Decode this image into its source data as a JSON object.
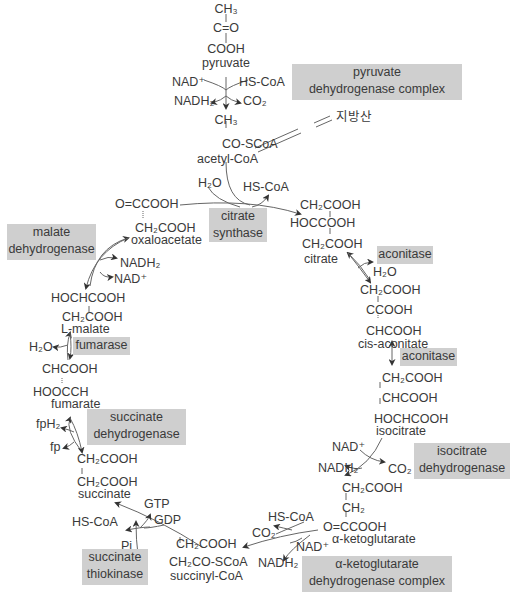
{
  "colors": {
    "enzyme_box": "#cfcfcf",
    "text": "#3a3a3a",
    "line": "#555555"
  },
  "pyruvate": {
    "ch3": "CH₃",
    "co": "C=O",
    "cooh": "COOH",
    "name": "pyruvate"
  },
  "pdh_step": {
    "nad": "NAD⁺",
    "hscoa": "HS-CoA",
    "nadh2": "NADH₂",
    "co2": "CO₂"
  },
  "acetyl_coa": {
    "ch3": "CH₃",
    "coscoa": "CO-SCoA",
    "name": "acetyl-CoA"
  },
  "fatty_acid": "지방산",
  "citrate_synthase_step": {
    "h2o": "H₂O",
    "hscoa": "HS-CoA"
  },
  "oxaloacetate": {
    "line1": "O=CCOOH",
    "line2": "CH₂COOH",
    "name": "oxaloacetate"
  },
  "citrate": {
    "line1": "CH₂COOH",
    "line2": "HOCCOOH",
    "line3": "CH₂COOH",
    "name": "citrate"
  },
  "aconitase1_step": {
    "h2o": "H₂O"
  },
  "cis_aconitate": {
    "line1": "CH₂COOH",
    "line2": "CCOOH",
    "line3": "CHCOOH",
    "name": "cis-aconitate"
  },
  "isocitrate": {
    "line1": "CH₂COOH",
    "line2": "CHCOOH",
    "line3": "HOCHCOOH",
    "name": "isocitrate"
  },
  "icdh_step": {
    "nad": "NAD⁺",
    "nadh2": "NADH₂",
    "co2": "CO₂"
  },
  "alpha_kg": {
    "line1": "CH₂COOH",
    "line2": "CH₂",
    "line3": "O=CCOOH",
    "name": "α-ketoglutarate"
  },
  "akgdh_step": {
    "hscoa": "HS-CoA",
    "co2": "CO₂",
    "nad": "NAD⁺",
    "nadh2": "NADH₂"
  },
  "succinyl_coa": {
    "line1": "CH₂COOH",
    "line2": "CH₂CO-SCoA",
    "name": "succinyl-CoA"
  },
  "st_step": {
    "gtp": "GTP",
    "gdp": "GDP",
    "hscoa": "HS-CoA",
    "pi": "Pi"
  },
  "succinate": {
    "line1": "CH₂COOH",
    "line2": "CH₂COOH",
    "name": "succinate"
  },
  "sdh_step": {
    "fph2": "fpH₂",
    "fp": "fp"
  },
  "fumarate": {
    "line1": "CHCOOH",
    "line2": "HOOCCH",
    "name": "fumarate"
  },
  "fumarase_step": {
    "h2o": "H₂O"
  },
  "malate": {
    "line1": "HOCHCOOH",
    "line2": "CH₂COOH",
    "name": "L-malate"
  },
  "mdh_step": {
    "nadh2": "NADH₂",
    "nad": "NAD⁺"
  },
  "enzymes": {
    "pdh": {
      "line1": "pyruvate",
      "line2": "dehydrogenase complex"
    },
    "citrate_synthase": {
      "line1": "citrate",
      "line2": "synthase"
    },
    "aconitase1": "aconitase",
    "aconitase2": "aconitase",
    "icdh": {
      "line1": "isocitrate",
      "line2": "dehydrogenase"
    },
    "akgdh": {
      "line1": "α-ketoglutarate",
      "line2": "dehydrogenase complex"
    },
    "succinate_thiokinase": {
      "line1": "succinate",
      "line2": "thiokinase"
    },
    "sdh": {
      "line1": "succinate",
      "line2": "dehydrogenase"
    },
    "fumarase": "fumarase",
    "mdh": {
      "line1": "malate",
      "line2": "dehydrogenase"
    }
  }
}
